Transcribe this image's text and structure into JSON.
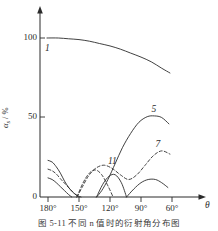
{
  "figure": {
    "caption": "图 5-11  不同 n 值时的衍射角分布图",
    "y_axis_title_main": "α",
    "y_axis_title_sub": "s",
    "y_axis_title_unit": " / %",
    "x_axis_title": "θ"
  },
  "chart_data": {
    "type": "line",
    "title": "",
    "xlabel": "θ",
    "ylabel": "αs / %",
    "xlim": [
      185,
      55
    ],
    "ylim": [
      0,
      110
    ],
    "x_ticks": [
      "180°",
      "150°",
      "120°",
      "90°",
      "60°"
    ],
    "x_tick_values": [
      180,
      150,
      120,
      90,
      60
    ],
    "y_ticks": [
      "0",
      "50",
      "100"
    ],
    "y_tick_values": [
      0,
      50,
      100
    ],
    "grid": false,
    "legend": "inline-curve-labels",
    "axis_arrows": true,
    "series": [
      {
        "name": "1",
        "label": "1",
        "style": "solid",
        "label_position": {
          "x": 180,
          "y": 93
        },
        "x": [
          181,
          170,
          160,
          150,
          140,
          130,
          120,
          110,
          100,
          90,
          80,
          70,
          62
        ],
        "y": [
          100,
          100,
          99.5,
          99,
          98,
          96.5,
          95,
          93,
          90.5,
          88,
          85,
          81,
          78
        ]
      },
      {
        "name": "5",
        "label": "5",
        "style": "solid",
        "label_position": {
          "x": 77,
          "y": 55
        },
        "x": [
          133,
          128,
          122,
          115,
          108,
          100,
          92,
          84,
          77,
          70,
          63
        ],
        "y": [
          0,
          4,
          11,
          21,
          31,
          40,
          47,
          50.5,
          51,
          50,
          46
        ]
      },
      {
        "name": "7",
        "label": "7",
        "style": "dashed",
        "label_position": {
          "x": 73,
          "y": 33
        },
        "x": [
          152,
          147,
          141,
          134,
          126,
          118,
          110,
          102,
          94,
          86,
          78,
          70,
          62
        ],
        "y": [
          0,
          6,
          13,
          18,
          20,
          18,
          14,
          11,
          14,
          20,
          26,
          29,
          27
        ]
      },
      {
        "name": "11",
        "label": "11",
        "style": "solid",
        "label_position": {
          "x": 119,
          "y": 22
        },
        "x": [
          180,
          176,
          172,
          168,
          164,
          160,
          156,
          152,
          148
        ],
        "y": [
          23,
          22,
          19,
          15,
          10,
          6,
          3,
          1,
          0
        ]
      },
      {
        "name": "11b",
        "label": "",
        "style": "dashed",
        "label_position": null,
        "x": [
          180,
          176,
          172,
          168,
          163,
          158,
          154,
          150
        ],
        "y": [
          17.5,
          16.5,
          14.5,
          11.5,
          8,
          4.5,
          2,
          0
        ]
      },
      {
        "name": "11c",
        "label": "",
        "style": "solid",
        "label_position": null,
        "x": [
          180,
          176,
          172,
          168,
          164,
          160,
          157
        ],
        "y": [
          12,
          11,
          9,
          6.5,
          4,
          1.5,
          0
        ]
      },
      {
        "name": "11d",
        "label": "",
        "style": "solid",
        "label_position": null,
        "x": [
          133,
          127,
          121,
          115,
          109,
          104
        ],
        "y": [
          0,
          8,
          13,
          14,
          9,
          0
        ]
      },
      {
        "name": "11e",
        "label": "",
        "style": "dashed",
        "label_position": null,
        "x": [
          152,
          146,
          140,
          134,
          128,
          122,
          117
        ],
        "y": [
          0,
          9,
          15,
          17,
          14,
          7,
          0
        ]
      },
      {
        "name": "11f",
        "label": "",
        "style": "solid",
        "label_position": null,
        "x": [
          104,
          97,
          90,
          83,
          76,
          70,
          64
        ],
        "y": [
          0,
          5,
          9,
          11,
          11,
          9,
          6
        ]
      }
    ]
  }
}
